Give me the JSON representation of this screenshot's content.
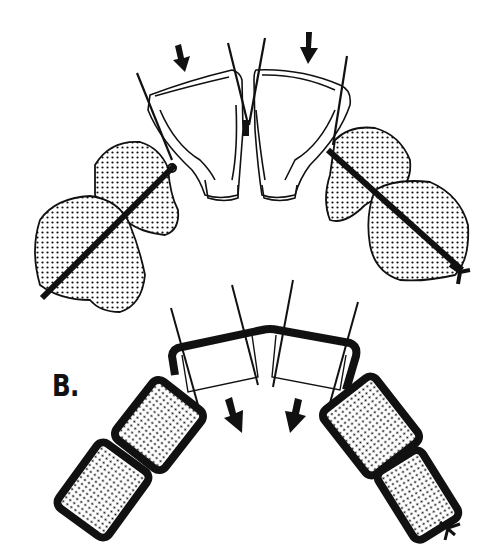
{
  "figure": {
    "panel_label": "B.",
    "colors": {
      "ink": "#111111",
      "background": "#ffffff"
    }
  },
  "elements": {
    "top_arrows": [
      "arrow-down-left",
      "arrow-down-right"
    ],
    "bottom_arrows": [
      "arrow-down-right",
      "arrow-down-left"
    ],
    "incisors": [
      "left-incisor",
      "right-incisor"
    ],
    "posterior_teeth_left": [
      "upper-left-molar",
      "lower-left-molar"
    ],
    "posterior_teeth_right": [
      "upper-right-molar",
      "lower-right-molar"
    ],
    "schematic_segments": [
      "left-bracket-segment-1",
      "left-bracket-segment-2",
      "center-bar",
      "right-bracket-segment-1",
      "right-bracket-segment-2"
    ]
  }
}
